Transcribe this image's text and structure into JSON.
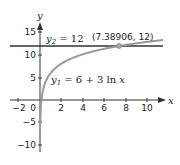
{
  "chart_data": {
    "type": "line",
    "title": "",
    "xlabel": "x",
    "ylabel": "y",
    "xlim": [
      -2.5,
      11.5
    ],
    "ylim": [
      -11,
      17
    ],
    "x_ticks": [
      "-2",
      "0",
      "2",
      "4",
      "6",
      "8",
      "10"
    ],
    "y_ticks": [
      "15",
      "10",
      "5",
      "-5",
      "-10"
    ],
    "series": [
      {
        "name": "y1 = 6 + 3 ln x",
        "function": "6 + 3*ln(x)",
        "color": "#9a9a9a"
      },
      {
        "name": "y2 = 12",
        "function": "12",
        "color": "#333333"
      }
    ],
    "annotations": [
      {
        "text": "y2 = 12",
        "position": "near horizontal line left"
      },
      {
        "text": "y1 = 6 + 3 ln x",
        "position": "near curve below"
      },
      {
        "text": "(7.38906, 12)",
        "point": [
          7.38906,
          12
        ]
      }
    ],
    "grid": false,
    "legend": "none"
  },
  "labels": {
    "x_axis": "x",
    "y_axis": "y",
    "y2_sub": "2",
    "y1_sub": "1",
    "y2_rest": " = 12",
    "y1_rest": " = 6 + 3 ln ",
    "y1_x": "x",
    "point": "(7.38906, 12)",
    "y_char": "y",
    "tick_x": [
      "−2",
      "0",
      "2",
      "4",
      "6",
      "8",
      "10"
    ],
    "tick_y": [
      "15",
      "10",
      "5",
      "−5",
      "−10"
    ]
  }
}
